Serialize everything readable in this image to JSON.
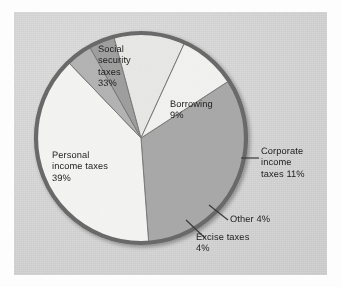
{
  "figure": {
    "kind": "pie-chart-scan",
    "background_color": "#d6d6d6",
    "page_color": "#fdfdfd",
    "outline_color": "#6a6a6a",
    "text_color": "#1d1d1d"
  },
  "chart_data": {
    "type": "pie",
    "title": "",
    "subtitle": "",
    "xlabel": "",
    "ylabel": "",
    "legend_position": "none",
    "grid": false,
    "units": "percent",
    "total": 100,
    "center": {
      "x": 141,
      "y": 138
    },
    "radius": 105,
    "start_angle_deg": -33,
    "direction": "clockwise",
    "categories": [
      "Social security taxes",
      "Personal income taxes",
      "Excise taxes",
      "Other",
      "Corporate income taxes",
      "Borrowing"
    ],
    "values": [
      33,
      39,
      4,
      4,
      11,
      9
    ],
    "slices": [
      {
        "name": "Social security taxes",
        "label": "Social\nsecurity\ntaxes\n33%",
        "value": 33,
        "value_text": "33%",
        "color": "#a9a9a9",
        "label_placement": "inside"
      },
      {
        "name": "Personal income taxes",
        "label": "Personal\nincome taxes\n39%",
        "value": 39,
        "value_text": "39%",
        "color": "#f4f4f2",
        "label_placement": "inside"
      },
      {
        "name": "Excise taxes",
        "label": "Excise taxes\n4%",
        "value": 4,
        "value_text": "4%",
        "color": "#b4b4b4",
        "label_placement": "callout"
      },
      {
        "name": "Other",
        "label": "Other 4%",
        "value": 4,
        "value_text": "4%",
        "color": "#9f9f9f",
        "label_placement": "callout"
      },
      {
        "name": "Corporate income taxes",
        "label": "Corporate\nincome\ntaxes 11%",
        "value": 11,
        "value_text": "11%",
        "color": "#e8e8e6",
        "label_placement": "callout"
      },
      {
        "name": "Borrowing",
        "label": "Borrowing\n9%",
        "value": 9,
        "value_text": "9%",
        "color": "#f2f2f0",
        "label_placement": "inside"
      }
    ]
  }
}
